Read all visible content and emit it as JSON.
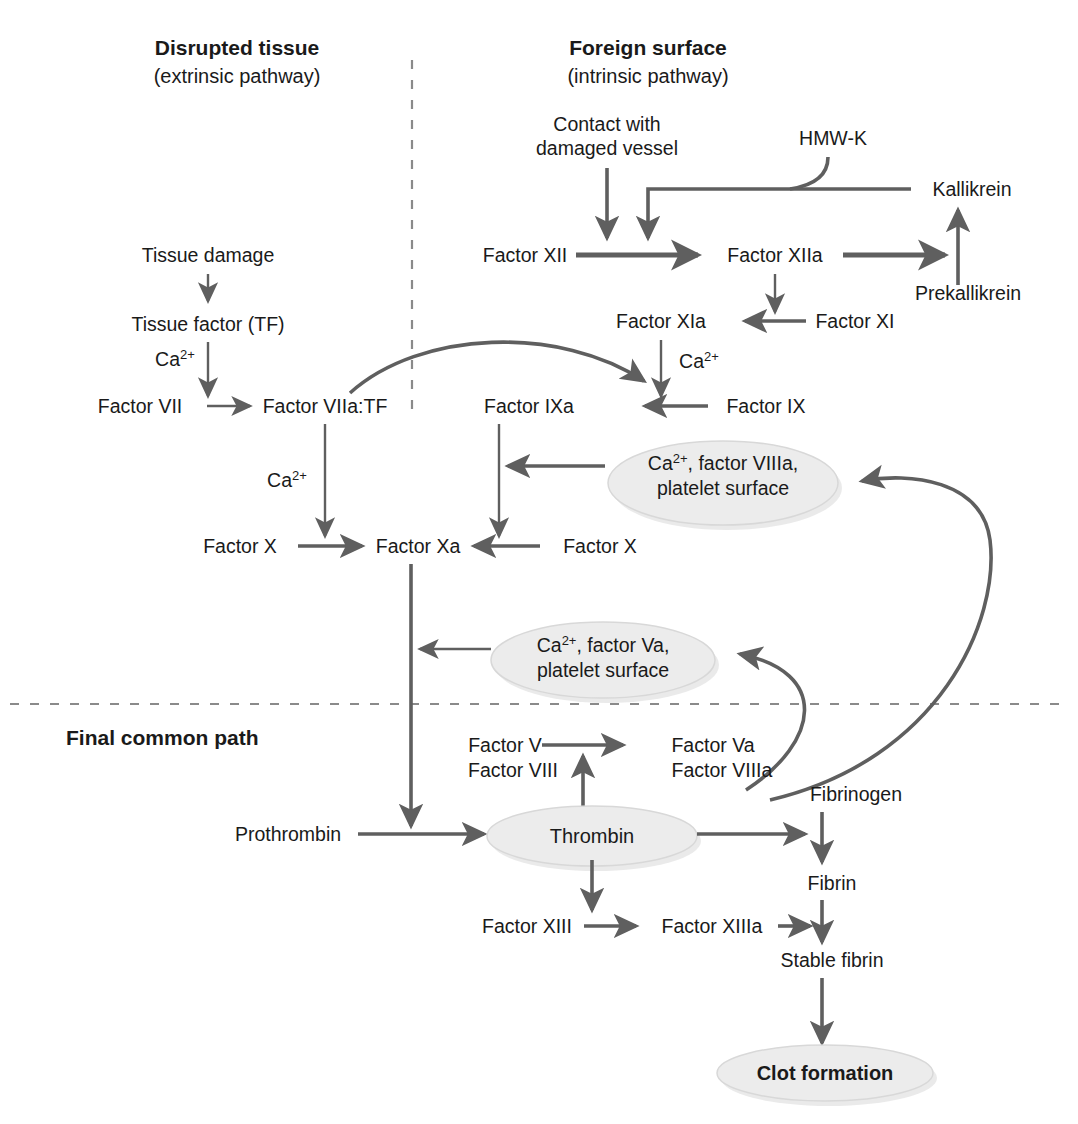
{
  "figure": {
    "colors": {
      "arrow": "#5f5f5f",
      "text": "#1a1a1a",
      "ellipse_fill": "#ececec",
      "ellipse_stroke": "#d8d8d8",
      "divider": "#8a8a8a",
      "background": "#ffffff"
    }
  },
  "headings": {
    "extrinsic": {
      "title": "Disrupted tissue",
      "subtitle": "(extrinsic pathway)"
    },
    "intrinsic": {
      "title": "Foreign surface",
      "subtitle": "(intrinsic pathway)"
    },
    "common": {
      "title": "Final common path"
    }
  },
  "nodes": {
    "tissue_damage": "Tissue damage",
    "tissue_factor": "Tissue factor (TF)",
    "factor_vii": "Factor VII",
    "factor_viia_tf": "Factor VIIa:TF",
    "contact_line1": "Contact with",
    "contact_line2": "damaged vessel",
    "hmwk": "HMW-K",
    "kallikrein": "Kallikrein",
    "prekallikrein": "Prekallikrein",
    "factor_xii": "Factor XII",
    "factor_xiia": "Factor XIIa",
    "factor_xi": "Factor XI",
    "factor_xia": "Factor XIa",
    "factor_ix": "Factor IX",
    "factor_ixa": "Factor IXa",
    "factor_x_left": "Factor X",
    "factor_xa": "Factor Xa",
    "factor_x_right": "Factor X",
    "prothrombin": "Prothrombin",
    "thrombin": "Thrombin",
    "factor_v": "Factor V",
    "factor_viii": "Factor VIII",
    "factor_va": "Factor Va",
    "factor_viiia": "Factor VIIIa",
    "fibrinogen": "Fibrinogen",
    "fibrin": "Fibrin",
    "factor_xiii": "Factor XIII",
    "factor_xiiia": "Factor XIIIa",
    "stable_fibrin": "Stable fibrin",
    "clot_formation": "Clot formation"
  },
  "cofactors": {
    "ca_base": "Ca",
    "ca_sup": "2+",
    "viiia_complex_line1_prefix": "Ca",
    "viiia_complex_line1_sup": "2+",
    "viiia_complex_line1_rest": ", factor VIIIa,",
    "viiia_complex_line2": "platelet surface",
    "va_complex_line1_prefix": "Ca",
    "va_complex_line1_sup": "2+",
    "va_complex_line1_rest": ", factor Va,",
    "va_complex_line2": "platelet surface"
  },
  "icons": {
    "arrowhead": "arrowhead-icon",
    "dashed_divider_vertical": "vertical-dashed-divider-icon",
    "dashed_divider_horizontal": "horizontal-dashed-divider-icon"
  }
}
